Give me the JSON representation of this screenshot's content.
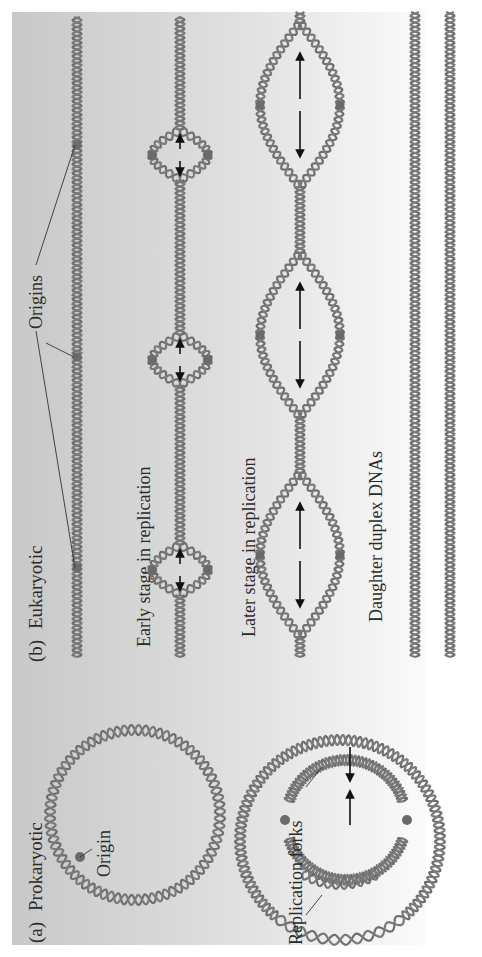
{
  "figure": {
    "orientation": "rotated 90deg counter-clockwise",
    "colors": {
      "panel_left": "#c9c9c9",
      "panel_right": "#fbfbfb",
      "dna": "#6f6f6f",
      "origin_dot": "#6a6a6a",
      "arrow": "#111111",
      "text": "#2a2a2a"
    }
  },
  "panel_a": {
    "label": "(a)",
    "title": "Prokaryotic",
    "origin_label": "Origin",
    "forks_label": "Replication forks"
  },
  "panel_b": {
    "label": "(b)",
    "title": "Eukaryotic",
    "origins_label": "Origins",
    "early_label": "Early stage in replication",
    "later_label": "Later stage in replication",
    "daughter_label": "Daughter duplex DNAs"
  }
}
